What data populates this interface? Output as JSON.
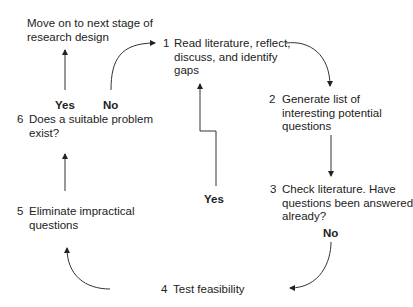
{
  "diagram": {
    "type": "flowchart-cycle",
    "nodes": [
      {
        "id": "1",
        "number": "1",
        "lines": [
          "Read literature, reflect,",
          "discuss, and identify",
          "gaps"
        ]
      },
      {
        "id": "2",
        "number": "2",
        "lines": [
          "Generate list of",
          "interesting potential",
          "questions"
        ]
      },
      {
        "id": "3",
        "number": "3",
        "lines": [
          "Check literature. Have",
          "questions been answered",
          "already?"
        ]
      },
      {
        "id": "4",
        "number": "4",
        "lines": [
          "Test feasibility"
        ]
      },
      {
        "id": "5",
        "number": "5",
        "lines": [
          "Eliminate impractical",
          "questions"
        ]
      },
      {
        "id": "6",
        "number": "6",
        "lines": [
          "Does a suitable problem",
          "exist?"
        ]
      },
      {
        "id": "end",
        "number": "",
        "lines": [
          "Move on to next stage of",
          "research design"
        ]
      }
    ],
    "edges": [
      {
        "from": "1",
        "to": "2",
        "label": ""
      },
      {
        "from": "2",
        "to": "3",
        "label": ""
      },
      {
        "from": "3",
        "to": "1",
        "label": "Yes"
      },
      {
        "from": "3",
        "to": "4",
        "label": "No"
      },
      {
        "from": "4",
        "to": "5",
        "label": ""
      },
      {
        "from": "5",
        "to": "6",
        "label": ""
      },
      {
        "from": "6",
        "to": "end",
        "label": "Yes"
      },
      {
        "from": "6",
        "to": "1",
        "label": "No"
      }
    ],
    "labels": {
      "yes": "Yes",
      "no": "No"
    }
  }
}
